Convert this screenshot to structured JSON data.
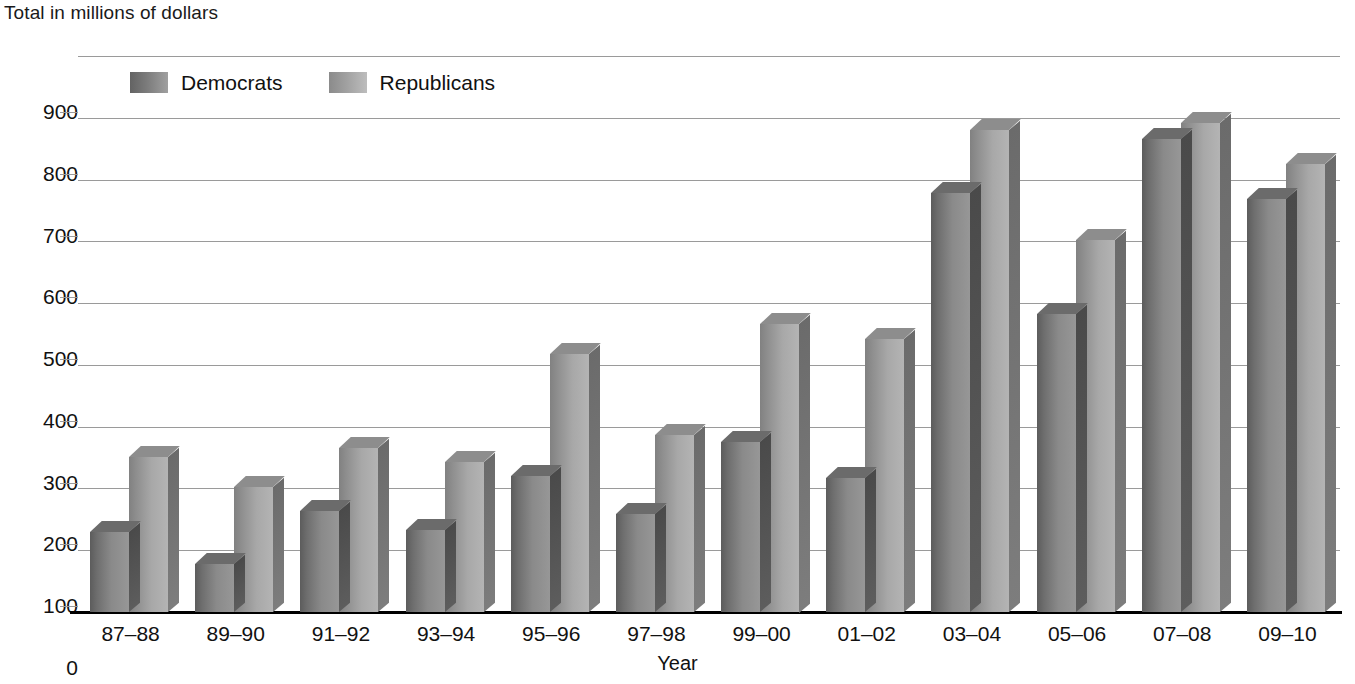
{
  "chart_data": {
    "type": "bar",
    "title": "Total in millions of dollars",
    "xlabel": "Year",
    "ylabel": "Total in millions of dollars",
    "ylim": [
      0,
      900
    ],
    "ytick_step": 100,
    "yticks": [
      "900",
      "800",
      "700",
      "600",
      "500",
      "400",
      "300",
      "200",
      "100",
      "0"
    ],
    "grid": true,
    "legend_position": "top-left-inside",
    "categories": [
      "87–88",
      "89–90",
      "91–92",
      "93–94",
      "95–96",
      "97–98",
      "99–00",
      "01–02",
      "03–04",
      "05–06",
      "07–08",
      "09–10"
    ],
    "series": [
      {
        "name": "Democrats",
        "color": "#7c7c7c",
        "values": [
          130,
          78,
          163,
          132,
          220,
          158,
          275,
          217,
          679,
          483,
          765,
          668
        ]
      },
      {
        "name": "Republicans",
        "color": "#a5a5a5",
        "values": [
          251,
          202,
          265,
          243,
          417,
          287,
          467,
          442,
          780,
          602,
          791,
          725
        ]
      }
    ]
  },
  "colors": {
    "democrats": "#7c7c7c",
    "republicans": "#a5a5a5",
    "gridline": "#9a9a9a",
    "axis": "#000000",
    "text": "#111111",
    "background": "#ffffff"
  }
}
